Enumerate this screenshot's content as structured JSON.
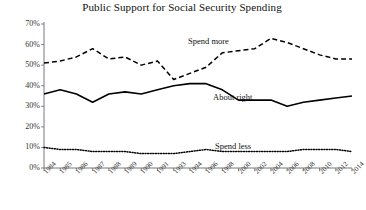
{
  "chart_data": {
    "type": "line",
    "title": "Public Support for Social Security Spending",
    "xlabel": "",
    "ylabel": "",
    "ylim": [
      0,
      70
    ],
    "yticks": [
      0,
      10,
      20,
      30,
      40,
      50,
      60,
      70
    ],
    "ytick_labels": [
      "0%",
      "10%",
      "20%",
      "30%",
      "40%",
      "50%",
      "60%",
      "70%"
    ],
    "grid": false,
    "legend_position": "inline-annotations",
    "x": [
      1984,
      1985,
      1986,
      1987,
      1988,
      1989,
      1990,
      1991,
      1993,
      1994,
      1996,
      1998,
      2000,
      2002,
      2004,
      2006,
      2008,
      2010,
      2012,
      2014
    ],
    "xtick_labels": [
      "1984",
      "1985",
      "1986",
      "1987",
      "1988",
      "1989",
      "1990",
      "1991",
      "1993",
      "1994",
      "1996",
      "1998",
      "2000",
      "2002",
      "2004",
      "2006",
      "2008",
      "2010",
      "2012",
      "2014"
    ],
    "series": [
      {
        "name": "Spend more",
        "style": "dashed",
        "color": "#000000",
        "values": [
          51,
          52,
          54,
          58,
          53,
          54,
          50,
          52,
          43,
          46,
          49,
          56,
          57,
          58,
          63,
          61,
          58,
          55,
          53,
          53
        ]
      },
      {
        "name": "About right",
        "style": "solid",
        "color": "#000000",
        "values": [
          36,
          38,
          36,
          32,
          36,
          37,
          36,
          38,
          40,
          41,
          41,
          38,
          33,
          33,
          33,
          30,
          32,
          33,
          34,
          35
        ]
      },
      {
        "name": "Spend less",
        "style": "dotted",
        "color": "#000000",
        "values": [
          10,
          9,
          9,
          8,
          8,
          8,
          7,
          7,
          7,
          8,
          9,
          8,
          8,
          8,
          8,
          8,
          9,
          9,
          9,
          8
        ]
      }
    ]
  },
  "annotations": {
    "spend_more": "Spend more",
    "about_right": "About right",
    "spend_less": "Spend less"
  },
  "colors": {
    "axis": "#555555",
    "line": "#000000",
    "background": "#ffffff",
    "text": "#1a1a1a"
  }
}
